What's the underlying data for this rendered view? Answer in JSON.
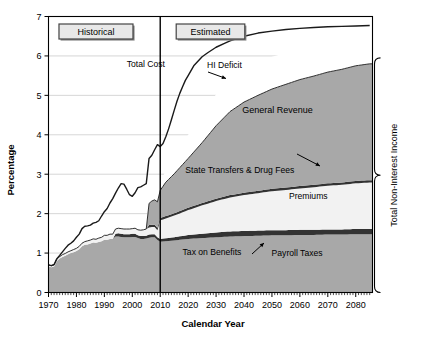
{
  "chart_data": {
    "type": "area",
    "title": "",
    "xlabel": "Calendar Year",
    "ylabel": "Percentage",
    "xlim": [
      1970,
      2086
    ],
    "ylim": [
      0,
      7
    ],
    "ytick_labels": [
      "0",
      "1",
      "2",
      "3",
      "4",
      "5",
      "6",
      "7"
    ],
    "ytick_values": [
      0,
      1,
      2,
      3,
      4,
      5,
      6,
      7
    ],
    "xtick_labels": [
      "1970",
      "1980",
      "1990",
      "2000",
      "2010",
      "2020",
      "2030",
      "2040",
      "2050",
      "2060",
      "2070",
      "2080"
    ],
    "xtick_values": [
      1970,
      1980,
      1990,
      2000,
      2010,
      2020,
      2030,
      2040,
      2050,
      2060,
      2070,
      2080
    ],
    "minor_tick_interval": 1,
    "grid": "horizontal",
    "legend_position": "inline-annotations",
    "period_divider_year": 2010,
    "period_labels": [
      {
        "text": "Historical",
        "year_center": 1987
      },
      {
        "text": "Estimated",
        "year_center": 2028
      }
    ],
    "annotations": [
      {
        "text": "Total Cost",
        "year": 1998,
        "value": 5.72,
        "arrow": true
      },
      {
        "text": "HI Deficit",
        "year": 2033,
        "value": 5.7,
        "arrow": false
      },
      {
        "text": "General Revenue",
        "year": 2052,
        "value": 4.55,
        "arrow": false
      },
      {
        "text": "State Transfers & Drug Fees",
        "year": 2019,
        "value": 3.02,
        "arrow": true
      },
      {
        "text": "Premiums",
        "year": 2063,
        "value": 2.36,
        "arrow": false
      },
      {
        "text": "Tax on Benefits",
        "year": 2018,
        "value": 0.95,
        "arrow": true
      },
      {
        "text": "Payroll Taxes",
        "year": 2059,
        "value": 0.92,
        "arrow": false
      }
    ],
    "bracket": {
      "label": "Total Non-Interest Income",
      "from_value": 5.95,
      "to_value": 0.0
    },
    "colors": {
      "band_gray": "#a8a8a8",
      "band_light": "#d9d9d9",
      "band_white": "#f2f2f2",
      "band_dark": "#333333",
      "line": "#1a1a1a",
      "grid": "#cccccc",
      "axis": "#000000",
      "box_fill_light": "#e8e8e8",
      "box_fill_dark": "#9a9a9a",
      "background": "#ffffff"
    },
    "series": [
      {
        "name": "Payroll Taxes",
        "fill": "#a8a8a8",
        "x": [
          1970,
          1971,
          1972,
          1973,
          1974,
          1975,
          1976,
          1977,
          1978,
          1979,
          1980,
          1981,
          1982,
          1983,
          1984,
          1985,
          1986,
          1987,
          1988,
          1989,
          1990,
          1991,
          1992,
          1993,
          1994,
          1995,
          1996,
          1997,
          1998,
          1999,
          2000,
          2001,
          2002,
          2003,
          2004,
          2005,
          2006,
          2007,
          2008,
          2009,
          2010,
          2015,
          2020,
          2025,
          2030,
          2035,
          2040,
          2045,
          2050,
          2055,
          2060,
          2065,
          2070,
          2075,
          2080,
          2085
        ],
        "values": [
          0.66,
          0.64,
          0.66,
          0.8,
          0.86,
          0.9,
          0.93,
          0.97,
          1.0,
          1.02,
          1.05,
          1.1,
          1.17,
          1.21,
          1.22,
          1.24,
          1.27,
          1.26,
          1.28,
          1.3,
          1.34,
          1.34,
          1.36,
          1.36,
          1.42,
          1.42,
          1.41,
          1.4,
          1.4,
          1.4,
          1.41,
          1.41,
          1.38,
          1.36,
          1.36,
          1.37,
          1.39,
          1.4,
          1.4,
          1.33,
          1.29,
          1.32,
          1.36,
          1.38,
          1.4,
          1.42,
          1.43,
          1.44,
          1.45,
          1.45,
          1.46,
          1.46,
          1.47,
          1.47,
          1.48,
          1.48
        ]
      },
      {
        "name": "Tax on Benefits",
        "fill": "#333333",
        "x": [
          1970,
          1993,
          1994,
          1995,
          1996,
          1997,
          1998,
          1999,
          2000,
          2001,
          2002,
          2003,
          2004,
          2005,
          2006,
          2007,
          2008,
          2009,
          2010,
          2015,
          2020,
          2025,
          2030,
          2035,
          2040,
          2045,
          2050,
          2055,
          2060,
          2065,
          2070,
          2075,
          2080,
          2085
        ],
        "values": [
          0.0,
          0.0,
          0.07,
          0.08,
          0.08,
          0.08,
          0.08,
          0.08,
          0.08,
          0.08,
          0.07,
          0.07,
          0.07,
          0.07,
          0.08,
          0.08,
          0.08,
          0.07,
          0.07,
          0.08,
          0.1,
          0.11,
          0.12,
          0.13,
          0.13,
          0.13,
          0.13,
          0.13,
          0.13,
          0.13,
          0.13,
          0.13,
          0.13,
          0.13
        ]
      },
      {
        "name": "Premiums",
        "fill": "#f2f2f2",
        "x": [
          1970,
          1971,
          1972,
          1973,
          1974,
          1975,
          1976,
          1977,
          1978,
          1979,
          1980,
          1981,
          1982,
          1983,
          1984,
          1985,
          1986,
          1987,
          1988,
          1989,
          1990,
          1991,
          1992,
          1993,
          1994,
          1995,
          1996,
          1997,
          1998,
          1999,
          2000,
          2001,
          2002,
          2003,
          2004,
          2005,
          2006,
          2007,
          2008,
          2009,
          2010,
          2015,
          2020,
          2025,
          2030,
          2035,
          2040,
          2045,
          2050,
          2055,
          2060,
          2065,
          2070,
          2075,
          2080,
          2085
        ],
        "values": [
          0.04,
          0.04,
          0.04,
          0.05,
          0.05,
          0.06,
          0.06,
          0.06,
          0.06,
          0.07,
          0.07,
          0.07,
          0.08,
          0.08,
          0.09,
          0.09,
          0.09,
          0.09,
          0.1,
          0.1,
          0.11,
          0.11,
          0.12,
          0.12,
          0.12,
          0.13,
          0.13,
          0.13,
          0.13,
          0.13,
          0.13,
          0.14,
          0.14,
          0.15,
          0.16,
          0.17,
          0.18,
          0.18,
          0.18,
          0.18,
          0.47,
          0.55,
          0.63,
          0.72,
          0.8,
          0.86,
          0.91,
          0.95,
          0.99,
          1.02,
          1.05,
          1.08,
          1.11,
          1.13,
          1.16,
          1.18
        ]
      },
      {
        "name": "State Transfers & Drug Fees",
        "fill": "#333333",
        "x": [
          1970,
          2005,
          2006,
          2007,
          2008,
          2009,
          2010,
          2015,
          2020,
          2025,
          2030,
          2035,
          2040,
          2045,
          2050,
          2055,
          2060,
          2065,
          2070,
          2075,
          2080,
          2085
        ],
        "values": [
          0.0,
          0.0,
          0.06,
          0.06,
          0.06,
          0.06,
          0.06,
          0.06,
          0.06,
          0.06,
          0.06,
          0.06,
          0.06,
          0.06,
          0.06,
          0.06,
          0.06,
          0.06,
          0.06,
          0.06,
          0.06,
          0.06
        ]
      },
      {
        "name": "General Revenue",
        "fill": "#a8a8a8",
        "x": [
          1970,
          1975,
          1980,
          1985,
          1990,
          1995,
          2000,
          2005,
          2006,
          2007,
          2008,
          2009,
          2010,
          2012,
          2015,
          2020,
          2025,
          2030,
          2035,
          2040,
          2045,
          2050,
          2055,
          2060,
          2065,
          2070,
          2075,
          2080,
          2085
        ],
        "values": [
          0.0,
          0.0,
          0.0,
          0.0,
          0.0,
          0.0,
          0.0,
          0.0,
          0.55,
          0.6,
          0.63,
          0.66,
          0.7,
          0.86,
          1.0,
          1.25,
          1.53,
          1.85,
          2.12,
          2.3,
          2.42,
          2.53,
          2.62,
          2.7,
          2.76,
          2.82,
          2.87,
          2.92,
          2.95
        ]
      },
      {
        "name": "HI Deficit",
        "fill": "#ffffff",
        "x": [
          1970,
          2010,
          2015,
          2020,
          2025,
          2030,
          2035,
          2040,
          2045,
          2050,
          2055,
          2060,
          2065,
          2070,
          2075,
          2080,
          2085
        ],
        "values": [
          0.0,
          0.2,
          0.45,
          0.6,
          0.72,
          0.8,
          0.84,
          0.85,
          0.84,
          0.82,
          0.8,
          0.78,
          0.76,
          0.74,
          0.73,
          0.72,
          0.72
        ]
      }
    ],
    "total_cost_line": {
      "name": "Total Cost",
      "x": [
        1970,
        1971,
        1972,
        1973,
        1974,
        1975,
        1976,
        1977,
        1978,
        1979,
        1980,
        1981,
        1982,
        1983,
        1984,
        1985,
        1986,
        1987,
        1988,
        1989,
        1990,
        1991,
        1992,
        1993,
        1994,
        1995,
        1996,
        1997,
        1998,
        1999,
        2000,
        2001,
        2002,
        2003,
        2004,
        2005,
        2006,
        2007,
        2008,
        2009,
        2010,
        2011,
        2012,
        2013,
        2014,
        2015,
        2016,
        2017,
        2018,
        2019,
        2020,
        2022,
        2025,
        2027,
        2030,
        2033,
        2035,
        2040,
        2045,
        2050,
        2055,
        2060,
        2065,
        2070,
        2075,
        2080,
        2085
      ],
      "values": [
        0.7,
        0.68,
        0.71,
        0.86,
        0.94,
        1.03,
        1.12,
        1.2,
        1.25,
        1.31,
        1.4,
        1.48,
        1.62,
        1.68,
        1.69,
        1.71,
        1.76,
        1.78,
        1.82,
        1.94,
        2.05,
        2.13,
        2.27,
        2.38,
        2.52,
        2.65,
        2.76,
        2.75,
        2.62,
        2.48,
        2.44,
        2.53,
        2.66,
        2.68,
        2.72,
        2.76,
        3.4,
        3.48,
        3.62,
        3.75,
        3.7,
        3.78,
        3.95,
        4.15,
        4.38,
        4.62,
        4.85,
        5.05,
        5.22,
        5.38,
        5.5,
        5.75,
        5.98,
        6.08,
        6.22,
        6.32,
        6.38,
        6.5,
        6.58,
        6.63,
        6.67,
        6.7,
        6.72,
        6.74,
        6.75,
        6.76,
        6.77
      ]
    }
  }
}
